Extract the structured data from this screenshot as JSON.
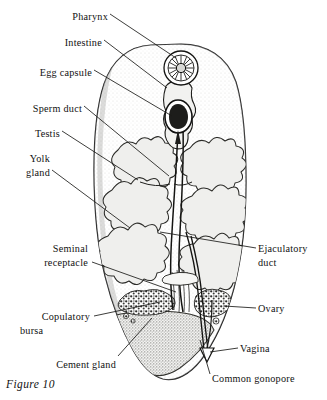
{
  "figure": {
    "caption": "Figure 10",
    "background_color": "#ffffff",
    "ink_color": "#1a1a1a",
    "fill_tone": "#e8e8e6"
  },
  "labels_left": [
    {
      "id": "pharynx",
      "text": "Pharynx",
      "text2": "",
      "x": 62,
      "y": 10
    },
    {
      "id": "intestine",
      "text": "Intestine",
      "text2": "",
      "x": 55,
      "y": 36
    },
    {
      "id": "egg-capsule",
      "text": "Egg capsule",
      "text2": "",
      "x": 36,
      "y": 66
    },
    {
      "id": "sperm-duct",
      "text": "Sperm duct",
      "text2": "",
      "x": 18,
      "y": 102
    },
    {
      "id": "testis",
      "text": "Testis",
      "text2": "",
      "x": 30,
      "y": 127
    },
    {
      "id": "yolk-gland",
      "text": "Yolk",
      "text2": "gland",
      "x": 22,
      "y": 152
    },
    {
      "id": "seminal-receptacle",
      "text": "Seminal",
      "text2": "receptacle",
      "x": 16,
      "y": 242
    },
    {
      "id": "copulatory-bursa",
      "text": "Copulatory",
      "text2": "bursa",
      "x": 22,
      "y": 310
    },
    {
      "id": "cement-gland",
      "text": "Cement gland",
      "text2": "",
      "x": 52,
      "y": 358
    }
  ],
  "labels_right": [
    {
      "id": "ejaculatory-duct",
      "text": "Ejaculatory",
      "text2": "duct",
      "x": 258,
      "y": 242
    },
    {
      "id": "ovary",
      "text": "Ovary",
      "text2": "",
      "x": 258,
      "y": 302
    },
    {
      "id": "vagina",
      "text": "Vagina",
      "text2": "",
      "x": 240,
      "y": 342
    },
    {
      "id": "common-gonopore",
      "text": "Common gonopore",
      "text2": "",
      "x": 212,
      "y": 372
    }
  ],
  "structures": [
    {
      "id": "body-outline",
      "name": "worm-body-outline"
    },
    {
      "id": "pharynx-organ",
      "name": "pharynx-radial-sucker",
      "cx": 181,
      "cy": 68,
      "r": 17
    },
    {
      "id": "egg-capsule-organ",
      "name": "egg-capsule-teardrop",
      "cx": 178,
      "cy": 116
    },
    {
      "id": "intestine-branch",
      "name": "branched-intestine"
    },
    {
      "id": "testis-left",
      "name": "testis-rosette-left"
    },
    {
      "id": "testis-right",
      "name": "testis-rosette-right"
    },
    {
      "id": "yolk-gland-mass",
      "name": "yolk-gland-branched-mass"
    },
    {
      "id": "sperm-duct-line",
      "name": "sperm-duct-tube"
    },
    {
      "id": "ejaculatory-tube",
      "name": "ejaculatory-duct-tube"
    },
    {
      "id": "copulatory-bursa-mass",
      "name": "copulatory-bursa-granular"
    },
    {
      "id": "ovary-mass",
      "name": "ovary-granular"
    },
    {
      "id": "cement-gland-mass",
      "name": "cement-gland-stippled"
    },
    {
      "id": "vagina-tube",
      "name": "vagina-tube"
    },
    {
      "id": "gonopore-notch",
      "name": "common-gonopore-notch"
    }
  ]
}
